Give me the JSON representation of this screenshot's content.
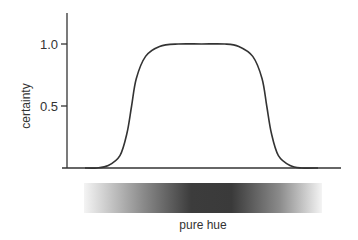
{
  "chart_data": {
    "type": "line",
    "title": "",
    "xlabel": "pure hue",
    "ylabel": "certainty",
    "ylim": [
      0,
      1.25
    ],
    "xlim": [
      0,
      1
    ],
    "yticks": [
      {
        "value": 1.0,
        "label": "1.0"
      },
      {
        "value": 0.5,
        "label": "0.5"
      }
    ],
    "grid": false,
    "legend": "none",
    "series": [
      {
        "name": "certainty",
        "x": [
          0.0,
          0.05,
          0.1,
          0.15,
          0.18,
          0.2,
          0.22,
          0.26,
          0.32,
          0.4,
          0.5,
          0.6,
          0.66,
          0.72,
          0.76,
          0.78,
          0.8,
          0.83,
          0.88,
          0.93,
          1.0
        ],
        "y": [
          0.0,
          0.0,
          0.02,
          0.1,
          0.28,
          0.5,
          0.72,
          0.9,
          0.98,
          1.0,
          1.0,
          1.0,
          0.98,
          0.9,
          0.72,
          0.5,
          0.28,
          0.1,
          0.02,
          0.0,
          0.0
        ]
      }
    ],
    "gradient_bar": {
      "description": "hue intensity band: light at edges, darkest in middle",
      "stops": [
        {
          "pos": 0.0,
          "color": "#f4f4f4"
        },
        {
          "pos": 0.25,
          "color": "#8a8a8a"
        },
        {
          "pos": 0.45,
          "color": "#3c3c3c"
        },
        {
          "pos": 0.62,
          "color": "#3a3a3a"
        },
        {
          "pos": 0.82,
          "color": "#8a8a8a"
        },
        {
          "pos": 1.0,
          "color": "#f4f4f4"
        }
      ]
    },
    "colors": {
      "line": "#333333",
      "axis": "#333333"
    }
  }
}
